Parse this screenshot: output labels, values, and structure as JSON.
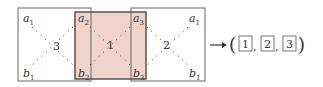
{
  "diagram": {
    "colors": {
      "stroke": "#555555",
      "overlap_fill": "#f0d4cc",
      "dots": "#333333"
    },
    "squares": [
      {
        "id": "left",
        "label": "3",
        "corners": {
          "top_left": "a1",
          "bottom_left": "b1",
          "top_right": "a2",
          "bottom_right": "b2"
        }
      },
      {
        "id": "middle",
        "label": "1",
        "corners": {
          "top_left": "a2",
          "bottom_left": "b2",
          "top_right": "a3",
          "bottom_right": "b3"
        },
        "highlighted": true
      },
      {
        "id": "right",
        "label": "2",
        "corners": {
          "top_left": "a3",
          "bottom_left": "b3",
          "top_right": "a1",
          "bottom_right": "b1"
        }
      }
    ],
    "labels": {
      "a1_left": "a",
      "a1_left_sub": "1",
      "b1_left": "b",
      "b1_left_sub": "1",
      "a2": "a",
      "a2_sub": "2",
      "b2": "b",
      "b2_sub": "2",
      "a3": "a",
      "a3_sub": "3",
      "b3": "b",
      "b3_sub": "3",
      "a1_right": "a",
      "a1_right_sub": "1",
      "b1_right": "b",
      "b1_right_sub": "1",
      "num_left": "3",
      "num_middle": "1",
      "num_right": "2"
    },
    "result": {
      "arrow": "→",
      "open_paren": "(",
      "close_paren": ")",
      "items": [
        "1",
        "2",
        "3"
      ],
      "separator": ","
    }
  }
}
